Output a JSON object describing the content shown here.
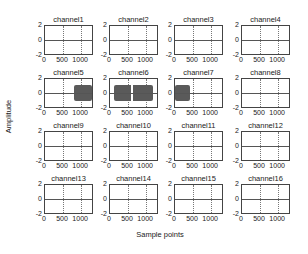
{
  "chart_data": {
    "type": "line",
    "layout": "4x4 subplots",
    "xlabel": "Sample points",
    "ylabel": "Amplitude",
    "grid": true,
    "shared_axes": {
      "xlim": [
        0,
        1300
      ],
      "ylim": [
        -2,
        2
      ],
      "xticks": [
        "0",
        "500",
        "1000"
      ],
      "yticks": [
        "2",
        "0",
        "-2"
      ]
    },
    "subplots": [
      {
        "title": "channel1",
        "signal": "flat ~0"
      },
      {
        "title": "channel2",
        "signal": "flat ~0"
      },
      {
        "title": "channel3",
        "signal": "flat ~0"
      },
      {
        "title": "channel4",
        "signal": "flat ~0"
      },
      {
        "title": "channel5",
        "signal": "burst",
        "burst_x": [
          800,
          1300
        ],
        "amplitude": 1.1
      },
      {
        "title": "channel6",
        "signal": "burst",
        "burst_x": [
          100,
          1200
        ],
        "amplitude": 1.1,
        "gap_x": [
          580,
          650
        ]
      },
      {
        "title": "channel7",
        "signal": "burst",
        "burst_x": [
          0,
          420
        ],
        "amplitude": 1.1
      },
      {
        "title": "channel8",
        "signal": "flat ~0"
      },
      {
        "title": "channel9",
        "signal": "flat ~0"
      },
      {
        "title": "channel10",
        "signal": "flat ~0"
      },
      {
        "title": "channel11",
        "signal": "flat ~0"
      },
      {
        "title": "channel12",
        "signal": "flat ~0"
      },
      {
        "title": "channel13",
        "signal": "flat ~0"
      },
      {
        "title": "channel14",
        "signal": "flat ~0"
      },
      {
        "title": "channel15",
        "signal": "flat ~0"
      },
      {
        "title": "channel16",
        "signal": "flat ~0"
      }
    ]
  }
}
